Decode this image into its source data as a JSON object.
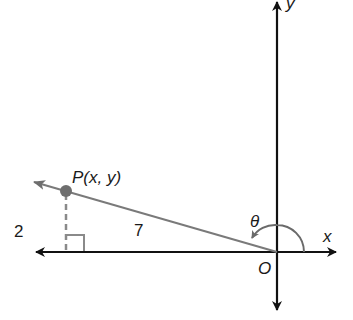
{
  "diagram": {
    "point_label": "P(x, y)",
    "origin_label": "O",
    "x_axis_label": "x",
    "y_axis_label": "y",
    "angle_label": "θ",
    "side_vertical": "2",
    "side_hypotenuse": "7",
    "colors": {
      "axis": "#111111",
      "ray": "#7a7a7a",
      "point": "#6e6e6e",
      "arc": "#6a6a6a"
    }
  }
}
